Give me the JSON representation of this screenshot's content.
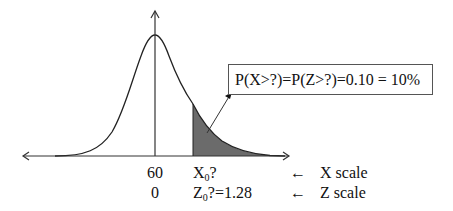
{
  "figure": {
    "type": "normal-distribution-diagram",
    "shaded_region": "right tail",
    "colors": {
      "curve": "#222222",
      "shade": "#6b6b6b",
      "axis": "#333333"
    }
  },
  "callout": {
    "text": "P(X>?)=P(Z>?)=0.10 = 10%"
  },
  "x_labels": {
    "mean": "60",
    "cutoff_prefix": "X",
    "cutoff_sub": "0",
    "cutoff_suffix": "?"
  },
  "z_labels": {
    "mean": "0",
    "cutoff_prefix": "Z",
    "cutoff_sub": "0",
    "cutoff_suffix": "?=1.28"
  },
  "scales": {
    "x_arrow": "←",
    "x_label": "X scale",
    "z_arrow": "←",
    "z_label": "Z scale"
  }
}
